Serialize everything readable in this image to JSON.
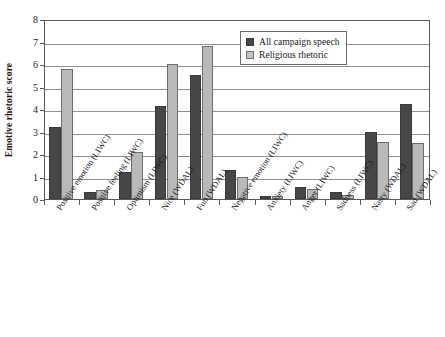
{
  "chart_data": {
    "type": "bar",
    "title": "",
    "xlabel": "",
    "ylabel": "Emotive rhetoric score",
    "ylim": [
      0,
      8
    ],
    "ytick_labels": [
      "0",
      "1",
      "2",
      "3",
      "4",
      "5",
      "6",
      "7",
      "8"
    ],
    "ytick_values": [
      0,
      1,
      2,
      3,
      4,
      5,
      6,
      7,
      8
    ],
    "grid": true,
    "legend_position": "upper right",
    "categories": [
      "Positive emotion (LIWC)",
      "Positive feeling (LIWC)",
      "Optimism (LIWC)",
      "Nice (WDAL)",
      "Fun (WDAL)",
      "Negative emotion (LIWC)",
      "Anxiety (LIWC)",
      "Anger (LIWC)",
      "Sadness (LIWC)",
      "Nasty (WDAL)",
      "Sad (WDAL)"
    ],
    "series": [
      {
        "name": "All campaign speech",
        "color": "#474747",
        "values": [
          3.22,
          0.32,
          1.19,
          4.15,
          5.52,
          1.27,
          0.15,
          0.54,
          0.3,
          2.98,
          4.24
        ]
      },
      {
        "name": "Religious rhetoric",
        "color": "#b9b9b9",
        "values": [
          5.8,
          0.39,
          2.09,
          6.0,
          6.8,
          1.0,
          0.12,
          0.46,
          0.18,
          2.52,
          2.5
        ]
      }
    ]
  },
  "legend": {
    "entries": [
      {
        "label": "All campaign speech"
      },
      {
        "label": "Religious rhetoric"
      }
    ]
  }
}
